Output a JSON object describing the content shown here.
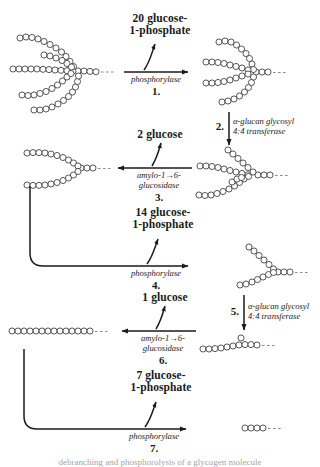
{
  "figure": {
    "caption": "debranching and phosphorolysis of a glycogen molecule"
  },
  "colors": {
    "ink": "#1a1a1a",
    "residue_stroke": "#3a3a3a",
    "residue_fill": "#ffffff",
    "dash": "#8a8a8a"
  },
  "steps": [
    {
      "number": "1.",
      "enzyme": "phosphorylase",
      "product_line1": "20 glucose-",
      "product_line2": "1-phosphate",
      "direction": "right"
    },
    {
      "number": "2.",
      "enzyme_line1": "α-glucan glycosyl",
      "enzyme_line2": "4:4 transferase",
      "direction": "down"
    },
    {
      "number": "3.",
      "enzyme_line1": "amylo-1→6-",
      "enzyme_line2": "glucosidase",
      "product_line1": "2 glucose",
      "direction": "left"
    },
    {
      "number": "4.",
      "enzyme": "phosphorylase",
      "product_line1": "14 glucose-",
      "product_line2": "1-phosphate",
      "direction": "right"
    },
    {
      "number": "5.",
      "enzyme_line1": "α-glucan glycosyl",
      "enzyme_line2": "4:4 transferase",
      "direction": "down"
    },
    {
      "number": "6.",
      "enzyme_line1": "amylo-1→6-",
      "enzyme_line2": "glucosidase",
      "product_line1": "1 glucose",
      "direction": "left"
    },
    {
      "number": "7.",
      "enzyme": "phosphorylase",
      "product_line1": "7 glucose-",
      "product_line2": "1-phosphate",
      "direction": "right"
    }
  ],
  "structures": [
    {
      "id": "glycogen-branched-start",
      "label": "branched glycogen molecule"
    },
    {
      "id": "glycogen-after-step1",
      "label": "limit dextrin with two branches"
    },
    {
      "id": "glycogen-after-step2",
      "label": "transferred branch structure"
    },
    {
      "id": "glycogen-after-step3",
      "label": "debranched two-arm structure"
    },
    {
      "id": "glycogen-after-step4",
      "label": "single branched chain"
    },
    {
      "id": "glycogen-after-step5",
      "label": "chain with single residue stub"
    },
    {
      "id": "glycogen-after-step6",
      "label": "linear glucose chain"
    },
    {
      "id": "glycogen-after-step7",
      "label": "short residual chain"
    }
  ]
}
